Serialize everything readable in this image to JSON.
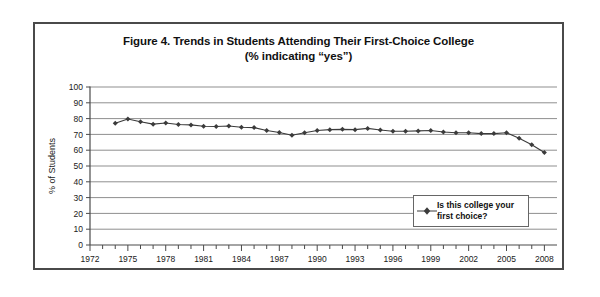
{
  "figure": {
    "title_line1": "Figure 4. Trends in Students Attending Their First-Choice College",
    "title_line2": "(% indicating “yes”)",
    "border_color": "#4a4a4a",
    "background": "#ffffff"
  },
  "legend": {
    "label": "Is this college your first choice?",
    "marker_icon": "diamond-marker-icon",
    "position": "inside-lower-right"
  },
  "chart_data": {
    "type": "line",
    "title": "Figure 4. Trends in Students Attending Their First-Choice College (% indicating “yes”)",
    "xlabel": "",
    "ylabel": "% of Students",
    "ylim": [
      0,
      100
    ],
    "ytick_step": 10,
    "yticks": [
      0,
      10,
      20,
      30,
      40,
      50,
      60,
      70,
      80,
      90,
      100
    ],
    "xlim": [
      1972,
      2009
    ],
    "xtick_labels": [
      "1972",
      "1975",
      "1978",
      "1981",
      "1984",
      "1987",
      "1990",
      "1993",
      "1996",
      "1999",
      "2002",
      "2005",
      "2008"
    ],
    "xtick_label_step": 3,
    "xtick_minor_step": 1,
    "grid": "horizontal",
    "legend_position": "inside-lower-right",
    "series": [
      {
        "name": "Is this college your first choice?",
        "marker": "diamond",
        "color": "#3b3b3b",
        "x": [
          1974,
          1975,
          1976,
          1977,
          1978,
          1979,
          1980,
          1981,
          1982,
          1983,
          1984,
          1985,
          1986,
          1987,
          1988,
          1989,
          1990,
          1991,
          1992,
          1993,
          1994,
          1995,
          1996,
          1997,
          1998,
          1999,
          2000,
          2001,
          2002,
          2003,
          2004,
          2005,
          2006,
          2007,
          2008
        ],
        "values": [
          77.0,
          79.8,
          78.0,
          76.5,
          77.2,
          76.3,
          76.0,
          75.2,
          75.0,
          75.3,
          74.5,
          74.3,
          72.5,
          71.2,
          69.5,
          71.0,
          72.5,
          73.0,
          73.2,
          73.0,
          73.8,
          72.8,
          72.0,
          72.0,
          72.2,
          72.5,
          71.5,
          71.0,
          71.0,
          70.5,
          70.5,
          71.0,
          67.5,
          63.5,
          58.5
        ]
      }
    ]
  }
}
